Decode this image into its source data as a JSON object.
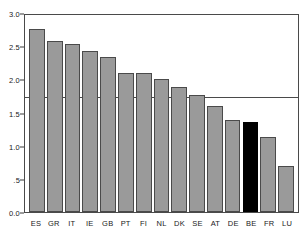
{
  "chart_data": {
    "type": "bar",
    "title": "",
    "subtitle": "",
    "xlabel": "",
    "ylabel": "",
    "categories": [
      "ES",
      "GR",
      "IT",
      "IE",
      "GB",
      "PT",
      "FI",
      "NL",
      "DK",
      "SE",
      "AT",
      "DE",
      "BE",
      "FR",
      "LU"
    ],
    "values": [
      2.76,
      2.58,
      2.53,
      2.43,
      2.34,
      2.1,
      2.09,
      2.0,
      1.89,
      1.76,
      1.6,
      1.39,
      1.35,
      1.13,
      0.69
    ],
    "bar_colors": [
      "#9a9a9a",
      "#9a9a9a",
      "#9a9a9a",
      "#9a9a9a",
      "#9a9a9a",
      "#9a9a9a",
      "#9a9a9a",
      "#9a9a9a",
      "#9a9a9a",
      "#9a9a9a",
      "#9a9a9a",
      "#9a9a9a",
      "#000000",
      "#9a9a9a",
      "#9a9a9a"
    ],
    "highlight_category": "BE",
    "ylim": [
      0.0,
      3.0
    ],
    "yticks": [
      0.0,
      0.5,
      1.0,
      1.5,
      2.0,
      2.5,
      3.0
    ],
    "ytick_labels": [
      "0.0",
      ".5",
      "1.0",
      "1.5",
      "2.0",
      "2.5",
      "3.0"
    ],
    "grid": false,
    "legend": null,
    "annotations": [
      {
        "type": "hline",
        "value": 1.76,
        "label": ""
      }
    ],
    "colors": {
      "bar_fill": "#9a9a9a",
      "bar_edge": "#4a4a4a",
      "highlight_fill": "#000000",
      "axis": "#4a4a4a",
      "text": "#1a1a1a",
      "background": "#ffffff"
    }
  }
}
